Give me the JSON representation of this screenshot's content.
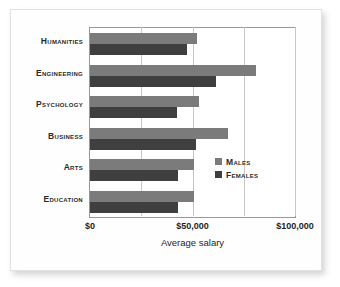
{
  "chart_data": {
    "type": "bar",
    "orientation": "horizontal",
    "title": "",
    "xlabel": "Average salary",
    "ylabel": "",
    "xlim": [
      0,
      100000
    ],
    "xticks": [
      0,
      50000,
      100000
    ],
    "xtick_labels": [
      "$0",
      "$50,000",
      "$100,000"
    ],
    "minor_gridlines": [
      25000,
      75000
    ],
    "grid": true,
    "legend_position": "center-right",
    "categories": [
      "Humanities",
      "Engineering",
      "Psychology",
      "Business",
      "Arts",
      "Education"
    ],
    "series": [
      {
        "name": "Males",
        "color": "#7b7b7b",
        "values": [
          52000,
          81000,
          53000,
          67500,
          50500,
          50500
        ]
      },
      {
        "name": "Females",
        "color": "#3f3f3f",
        "values": [
          47500,
          61500,
          42500,
          51500,
          43000,
          43000
        ]
      }
    ]
  },
  "axis": {
    "x_title": "Average salary",
    "tick_labels": [
      "$0",
      "$50,000",
      "$100,000"
    ]
  },
  "legend": {
    "entries": [
      {
        "label": "Males",
        "color": "#7b7b7b"
      },
      {
        "label": "Females",
        "color": "#3f3f3f"
      }
    ]
  }
}
